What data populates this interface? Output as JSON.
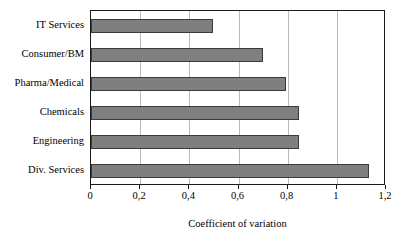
{
  "chart_data": {
    "type": "bar",
    "orientation": "horizontal",
    "title": "",
    "xlabel": "Coefficient of variation",
    "ylabel": "",
    "categories": [
      "IT Services",
      "Consumer/BM",
      "Pharma/Medical",
      "Chemicals",
      "Engineering",
      "Div. Services"
    ],
    "values": [
      0.495,
      0.7,
      0.795,
      0.845,
      0.845,
      1.13
    ],
    "xlim": [
      0,
      1.2
    ],
    "xticks": [
      0,
      0.2,
      0.4,
      0.6,
      0.8,
      1,
      1.2
    ],
    "xtick_labels": [
      "0",
      "0,2",
      "0,4",
      "0,6",
      "0,8",
      "1",
      "1,2"
    ],
    "grid": "vertical",
    "legend": "none",
    "bar_color": "#7f7f7f",
    "bar_edge_color": "#3a3a3a",
    "gridline_color": "#b9b9b9",
    "frame_color": "#1a1a1a",
    "background": "#ffffff"
  }
}
